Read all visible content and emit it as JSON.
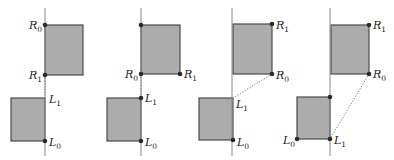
{
  "figure": {
    "colors": {
      "rect_fill": "#acacac",
      "rect_stroke": "#4a4a4a",
      "axis": "#8a8a8a",
      "dotted": "#777777",
      "point": "#2b2b2b"
    },
    "panels": [
      {
        "id": 1,
        "axis": {
          "x": 45,
          "y1": 8,
          "y2": 156
        },
        "upper_rect": {
          "x": 45,
          "y": 25,
          "w": 38,
          "h": 50
        },
        "lower_rect": {
          "x": 11,
          "y": 98,
          "w": 34,
          "h": 43
        },
        "points": [
          {
            "x": 45,
            "y": 25,
            "label": "R",
            "sub": "0",
            "lx": 29,
            "ly": 29
          },
          {
            "x": 45,
            "y": 75,
            "label": "R",
            "sub": "1",
            "lx": 29,
            "ly": 79
          },
          {
            "x": 45,
            "y": 141,
            "label": "L",
            "sub": "0",
            "lx": 49,
            "ly": 146
          },
          {
            "x": 45,
            "y": 98,
            "label": "L",
            "sub": "1",
            "lx": 49,
            "ly": 103,
            "dot": false
          }
        ],
        "dotted": {
          "x1": 45,
          "y1": 75,
          "x2": 45,
          "y2": 98
        }
      },
      {
        "id": 2,
        "axis": {
          "x": 141,
          "y1": 8,
          "y2": 156
        },
        "upper_rect": {
          "x": 141,
          "y": 25,
          "w": 39,
          "h": 49
        },
        "lower_rect": {
          "x": 107,
          "y": 98,
          "w": 34,
          "h": 43
        },
        "points": [
          {
            "x": 141,
            "y": 25,
            "label": "",
            "sub": ""
          },
          {
            "x": 141,
            "y": 74,
            "label": "R",
            "sub": "0",
            "lx": 125,
            "ly": 78
          },
          {
            "x": 180,
            "y": 74,
            "label": "R",
            "sub": "1",
            "lx": 184,
            "ly": 78
          },
          {
            "x": 141,
            "y": 98,
            "label": "L",
            "sub": "1",
            "lx": 145,
            "ly": 102
          },
          {
            "x": 141,
            "y": 141,
            "label": "L",
            "sub": "0",
            "lx": 145,
            "ly": 146
          }
        ],
        "dotted": {
          "x1": 141,
          "y1": 74,
          "x2": 141,
          "y2": 98
        }
      },
      {
        "id": 3,
        "axis": {
          "x": 232,
          "y1": 8,
          "y2": 156
        },
        "upper_rect": {
          "x": 233,
          "y": 24,
          "w": 39,
          "h": 50
        },
        "lower_rect": {
          "x": 199,
          "y": 98,
          "w": 34,
          "h": 42
        },
        "points": [
          {
            "x": 272,
            "y": 24,
            "label": "R",
            "sub": "1",
            "lx": 276,
            "ly": 29
          },
          {
            "x": 272,
            "y": 74,
            "label": "R",
            "sub": "0",
            "lx": 276,
            "ly": 79
          },
          {
            "x": 233,
            "y": 98,
            "label": "L",
            "sub": "1",
            "lx": 236,
            "ly": 108,
            "dot": false
          },
          {
            "x": 233,
            "y": 140,
            "label": "L",
            "sub": "0",
            "lx": 237,
            "ly": 146
          }
        ],
        "dotted": {
          "x1": 272,
          "y1": 74,
          "x2": 233,
          "y2": 98
        }
      },
      {
        "id": 4,
        "axis": {
          "x": 330,
          "y1": 8,
          "y2": 156
        },
        "upper_rect": {
          "x": 331,
          "y": 25,
          "w": 38,
          "h": 49
        },
        "lower_rect": {
          "x": 297,
          "y": 97,
          "w": 33,
          "h": 42
        },
        "points": [
          {
            "x": 369,
            "y": 25,
            "label": "R",
            "sub": "1",
            "lx": 373,
            "ly": 29
          },
          {
            "x": 369,
            "y": 74,
            "label": "R",
            "sub": "0",
            "lx": 373,
            "ly": 78
          },
          {
            "x": 330,
            "y": 97,
            "label": "",
            "sub": ""
          },
          {
            "x": 297,
            "y": 139,
            "label": "L",
            "sub": "0",
            "lx": 283,
            "ly": 144
          },
          {
            "x": 330,
            "y": 139,
            "label": "L",
            "sub": "1",
            "lx": 334,
            "ly": 144
          }
        ],
        "dotted": {
          "x1": 369,
          "y1": 74,
          "x2": 330,
          "y2": 139
        }
      }
    ]
  }
}
